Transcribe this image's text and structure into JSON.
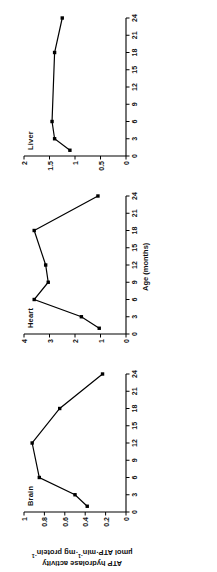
{
  "figure": {
    "y_axis_title_line1": "ATP hydrolase activity",
    "y_axis_title_line2_pre": "µmol ATP·min",
    "y_axis_title_line2_sup1": "-1",
    "y_axis_title_line2_mid": "·mg protein",
    "y_axis_title_line2_sup2": "-1",
    "x_axis_title": "Age (months)",
    "marker_color": "#000000",
    "line_color": "#000000",
    "axis_color": "#000000",
    "background": "#ffffff"
  },
  "chart_data": {
    "type": "line",
    "title": "",
    "xlabel": "Age (months)",
    "ylabel": "ATP hydrolase activity µmol ATP·min-1·mg protein-1",
    "xlim": [
      0,
      24
    ],
    "xticks": [
      0,
      3,
      6,
      9,
      12,
      15,
      18,
      21,
      24
    ],
    "xticklabels": [
      "0",
      "3",
      "6",
      "9",
      "12",
      "15",
      "18",
      "21",
      "24"
    ],
    "grid": false,
    "legend": "none",
    "marker": "square",
    "panels": [
      {
        "name": "brain",
        "label": "Brain",
        "ylim": [
          0,
          1
        ],
        "yticks": [
          0,
          0.2,
          0.4,
          0.6,
          0.8,
          1
        ],
        "yticklabels": [
          "0",
          "0.2",
          "0.4",
          "0.6",
          "0.8",
          "1"
        ],
        "x": [
          1,
          3,
          6,
          12,
          18,
          24
        ],
        "y": [
          0.38,
          0.5,
          0.85,
          0.92,
          0.65,
          0.23
        ]
      },
      {
        "name": "heart",
        "label": "Heart",
        "ylim": [
          0,
          4
        ],
        "yticks": [
          0,
          1,
          2,
          3,
          4
        ],
        "yticklabels": [
          "0",
          "1",
          "2",
          "3",
          "4"
        ],
        "x": [
          1,
          3,
          6,
          9,
          12,
          18,
          24
        ],
        "y": [
          1.05,
          1.75,
          3.6,
          3.05,
          3.15,
          3.6,
          1.1
        ]
      },
      {
        "name": "liver",
        "label": "Liver",
        "ylim": [
          0,
          2
        ],
        "yticks": [
          0,
          0.5,
          1,
          1.5,
          2
        ],
        "yticklabels": [
          "0",
          "0.5",
          "1",
          "1.5",
          "2"
        ],
        "x": [
          1,
          3,
          6,
          18,
          24
        ],
        "y": [
          1.1,
          1.4,
          1.45,
          1.4,
          1.25
        ]
      }
    ]
  }
}
